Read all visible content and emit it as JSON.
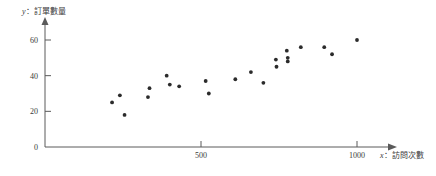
{
  "chart_data": {
    "type": "scatter",
    "title": "",
    "xlabel": "x：訪問次數",
    "ylabel": "y：訂單數量",
    "xlabel_var": "x",
    "xlabel_text": "：訪問次數",
    "ylabel_var": "y",
    "ylabel_text": "：訂單數量",
    "xlim": [
      0,
      1100
    ],
    "ylim": [
      0,
      68
    ],
    "xticks": [
      500,
      1000
    ],
    "xtick_labels": [
      "500",
      "1000"
    ],
    "yticks": [
      0,
      20,
      40,
      60
    ],
    "ytick_labels": [
      "0",
      "20",
      "40",
      "60"
    ],
    "grid": false,
    "legend": null,
    "point_color": "#2b2b2b",
    "axis_color": "#5a5a5a",
    "points": [
      {
        "x": 215,
        "y": 25
      },
      {
        "x": 240,
        "y": 29
      },
      {
        "x": 255,
        "y": 18
      },
      {
        "x": 330,
        "y": 28
      },
      {
        "x": 335,
        "y": 33
      },
      {
        "x": 390,
        "y": 40
      },
      {
        "x": 400,
        "y": 35
      },
      {
        "x": 430,
        "y": 34
      },
      {
        "x": 515,
        "y": 37
      },
      {
        "x": 525,
        "y": 30
      },
      {
        "x": 610,
        "y": 38
      },
      {
        "x": 660,
        "y": 42
      },
      {
        "x": 700,
        "y": 36
      },
      {
        "x": 740,
        "y": 49
      },
      {
        "x": 742,
        "y": 45
      },
      {
        "x": 775,
        "y": 54
      },
      {
        "x": 778,
        "y": 50
      },
      {
        "x": 778,
        "y": 48
      },
      {
        "x": 820,
        "y": 56
      },
      {
        "x": 895,
        "y": 56
      },
      {
        "x": 920,
        "y": 52
      },
      {
        "x": 1000,
        "y": 60
      }
    ]
  },
  "axes": {
    "x_axis_name": "horizontal-axis",
    "y_axis_name": "vertical-axis"
  }
}
